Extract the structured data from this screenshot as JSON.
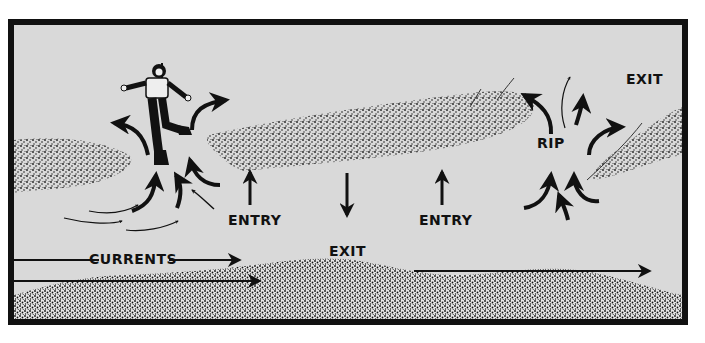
{
  "diagram": {
    "background_color": "#d9d9d9",
    "frame_color": "#111111",
    "reef_color": "#222222",
    "labels": {
      "entry_left": "ENTRY",
      "exit_center": "EXIT",
      "entry_right": "ENTRY",
      "rip": "RIP",
      "exit_right": "EXIT",
      "currents": "CURRENTS"
    },
    "elements": [
      {
        "name": "diver",
        "description": "Scuba diver swimming near reef gap"
      },
      {
        "name": "left-reef",
        "description": "Stippled reef patch, left"
      },
      {
        "name": "center-reef",
        "description": "Long stippled reef, center"
      },
      {
        "name": "right-reef",
        "description": "Stippled reef patch, right"
      },
      {
        "name": "shore",
        "description": "Stippled sandy shore along bottom"
      },
      {
        "name": "rip-arrows-left",
        "description": "Converging/diverging rip current arrows near diver"
      },
      {
        "name": "rip-arrows-right",
        "description": "Converging/diverging rip current arrows around RIP"
      },
      {
        "name": "longshore-arrows",
        "description": "Horizontal current arrows pointing right"
      }
    ]
  }
}
